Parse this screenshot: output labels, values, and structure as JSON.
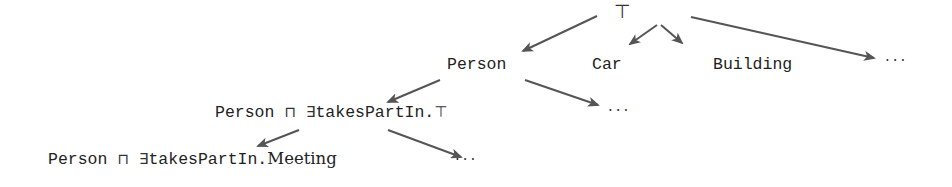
{
  "diagram": {
    "type": "concept refinement tree",
    "colors": {
      "text": "#222222",
      "arrow": "#555555",
      "background": "#ffffff"
    },
    "root": {
      "label": "⊤"
    },
    "level1": [
      {
        "label": "Person"
      },
      {
        "label": "Car"
      },
      {
        "label": "Building"
      },
      {
        "label": "···"
      }
    ],
    "level2": {
      "node": {
        "part1": "Person",
        "sqcap": "⊓",
        "exists": "∃",
        "part2": "takesPartIn.",
        "top": "⊤"
      },
      "ellipsis": "···"
    },
    "level3": {
      "node": {
        "part1": "Person",
        "sqcap": "⊓",
        "exists": "∃",
        "part2": "takesPartIn.",
        "filler": "Meeting"
      },
      "ellipsis": "···"
    },
    "edges": [
      {
        "from": "⊤",
        "to": "Person"
      },
      {
        "from": "⊤",
        "to": "Car"
      },
      {
        "from": "⊤",
        "to": "Building"
      },
      {
        "from": "⊤",
        "to": "···"
      },
      {
        "from": "Person",
        "to": "Person ⊓ ∃takesPartIn.⊤"
      },
      {
        "from": "Person",
        "to": "···"
      },
      {
        "from": "Person ⊓ ∃takesPartIn.⊤",
        "to": "Person ⊓ ∃takesPartIn.Meeting"
      },
      {
        "from": "Person ⊓ ∃takesPartIn.⊤",
        "to": "···"
      }
    ]
  }
}
